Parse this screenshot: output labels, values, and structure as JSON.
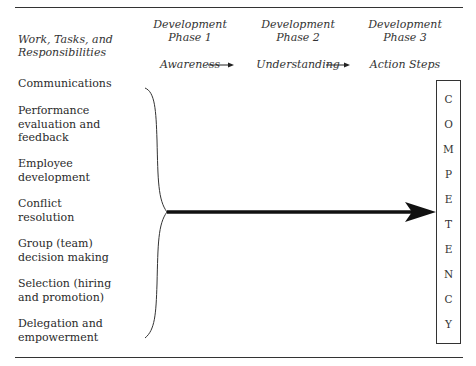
{
  "header": {
    "left_label": "Work, Tasks, and Responsibilities",
    "phases": [
      {
        "title": "Development",
        "subtitle": "Phase 1",
        "stage": "Awareness"
      },
      {
        "title": "Development",
        "subtitle": "Phase 2",
        "stage": "Understanding"
      },
      {
        "title": "Development",
        "subtitle": "Phase 3",
        "stage": "Action Steps"
      }
    ]
  },
  "tasks": [
    "Communications",
    "Performance evaluation and feedback",
    "Employee development",
    "Conflict resolution",
    "Group (team) decision making",
    "Selection (hiring and promotion)",
    "Delegation and empowerment"
  ],
  "task_lines": [
    [
      "Communications"
    ],
    [
      "Performance",
      "evaluation and",
      "feedback"
    ],
    [
      "Employee",
      "development"
    ],
    [
      "Conflict",
      "resolution"
    ],
    [
      "Group (team)",
      "decision making"
    ],
    [
      "Selection (hiring",
      "and promotion)"
    ],
    [
      "Delegation and",
      "empowerment"
    ]
  ],
  "outcome": {
    "label": "COMPETENCY",
    "letters": [
      "C",
      "O",
      "M",
      "P",
      "E",
      "T",
      "E",
      "N",
      "C",
      "Y"
    ]
  }
}
